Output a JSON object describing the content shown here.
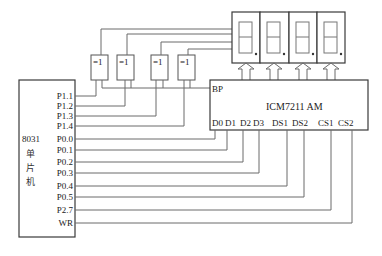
{
  "mcu": {
    "name": "8031",
    "name_cn": [
      "单",
      "片",
      "机"
    ],
    "pins": [
      "P1.1",
      "P1.2",
      "P1.3",
      "P1.4",
      "P0.0",
      "P0.1",
      "P0.2",
      "P0.3",
      "P0.4",
      "P0.5",
      "P2.7",
      "WR"
    ]
  },
  "gates": [
    {
      "label": "=1"
    },
    {
      "label": "=1"
    },
    {
      "label": "=1"
    },
    {
      "label": "=1"
    }
  ],
  "driver": {
    "name": "ICM7211 AM",
    "bp_label": "BP",
    "pins": [
      "D0",
      "D1",
      "D2",
      "D3",
      "DS1",
      "DS2",
      "CS1",
      "CS2"
    ]
  },
  "displays": {
    "count": 4,
    "type": "7-segment digit with decimal point"
  }
}
